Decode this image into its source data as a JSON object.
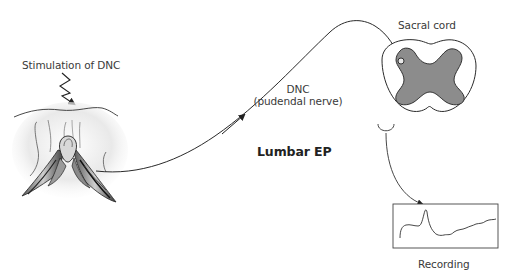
{
  "diagram": {
    "type": "neurophysiology-schematic",
    "labels": {
      "stimulation": "Stimulation of DNC",
      "nerve_title": "DNC",
      "nerve_subtitle": "(pudendal nerve)",
      "sacral_cord": "Sacral cord",
      "lumbar_ep": "Lumbar EP",
      "recording": "Recording"
    },
    "components": [
      {
        "id": "stimulation-site",
        "description": "Anatomical illustration of external genitalia with stimulation arrow"
      },
      {
        "id": "pudendal-nerve",
        "description": "Curved nerve path from genitalia to sacral spinal cord"
      },
      {
        "id": "conduction-arrow",
        "description": "Short arrow indicating afferent conduction direction"
      },
      {
        "id": "sacral-cord",
        "description": "Cross-section of sacral spinal cord with grey matter butterfly"
      },
      {
        "id": "recording-electrode",
        "description": "Surface electrode below spinal cord leading to recorder"
      },
      {
        "id": "recording-trace",
        "description": "Evoked potential waveform in rectangular display"
      }
    ],
    "colors": {
      "line": "#2a2a2a",
      "grey_matter": "#8c8c8c",
      "grey_matter_outline": "#333333",
      "cord_outline": "#2a2a2a",
      "text": "#3a3a3a",
      "background": "#ffffff"
    }
  }
}
